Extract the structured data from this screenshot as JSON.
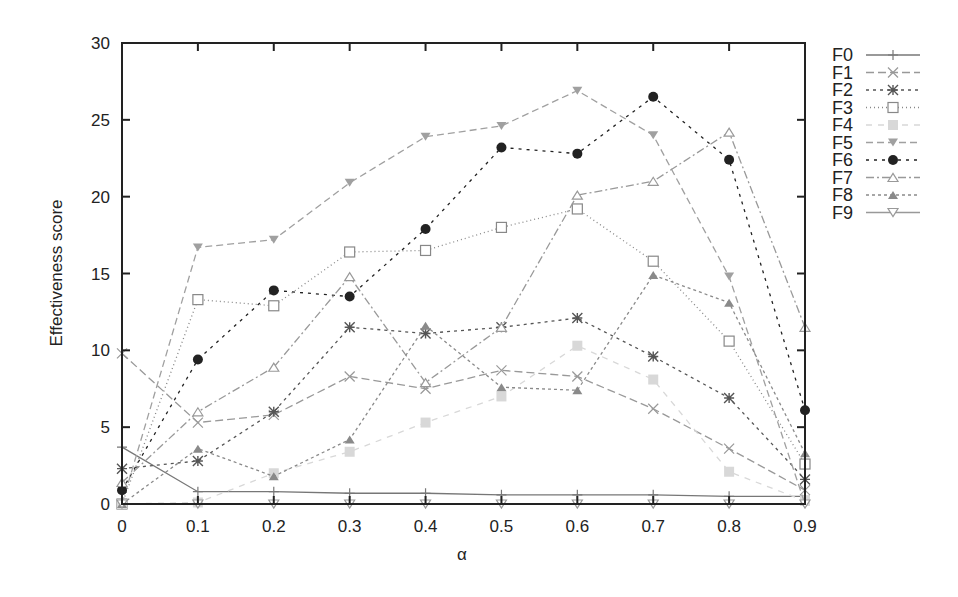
{
  "chart_data": {
    "type": "line",
    "title": "",
    "xlabel": "α",
    "ylabel": "Effectiveness score",
    "xlim": [
      0,
      0.9
    ],
    "ylim": [
      0,
      30
    ],
    "grid": false,
    "legend_position": "right-outside",
    "x": [
      0,
      0.1,
      0.2,
      0.3,
      0.4,
      0.5,
      0.6,
      0.7,
      0.8,
      0.9
    ],
    "x_tick_labels": [
      "0",
      "0.1",
      "0.2",
      "0.3",
      "0.4",
      "0.5",
      "0.6",
      "0.7",
      "0.8",
      "0.9"
    ],
    "y_ticks": [
      0,
      5,
      10,
      15,
      20,
      25,
      30
    ],
    "y_tick_labels": [
      "0",
      "5",
      "10",
      "15",
      "20",
      "25",
      "30"
    ],
    "series": [
      {
        "name": "F0",
        "marker": "plus",
        "dash": "solid",
        "color": "#777777",
        "values": [
          3.7,
          0.8,
          0.8,
          0.7,
          0.7,
          0.6,
          0.6,
          0.6,
          0.5,
          0.5
        ]
      },
      {
        "name": "F1",
        "marker": "x",
        "dash": "8,4",
        "color": "#999999",
        "values": [
          9.8,
          5.3,
          5.8,
          8.3,
          7.5,
          8.7,
          8.3,
          6.2,
          3.6,
          0.9
        ]
      },
      {
        "name": "F2",
        "marker": "star",
        "dash": "3,4",
        "color": "#555555",
        "values": [
          2.3,
          2.8,
          6.0,
          11.5,
          11.1,
          11.5,
          12.1,
          9.6,
          6.9,
          1.6
        ]
      },
      {
        "name": "F3",
        "marker": "square-open",
        "dash": "1,3",
        "color": "#888888",
        "values": [
          0.0,
          13.3,
          12.9,
          16.4,
          16.5,
          18.0,
          19.2,
          15.8,
          10.6,
          2.6
        ]
      },
      {
        "name": "F4",
        "marker": "square-filled",
        "dash": "6,6",
        "color": "#d8d8d8",
        "values": [
          0.0,
          0.1,
          2.0,
          3.4,
          5.3,
          7.0,
          10.3,
          8.1,
          2.1,
          0.2
        ]
      },
      {
        "name": "F5",
        "marker": "triangle-down-filled",
        "dash": "7,4",
        "color": "#a0a0a0",
        "values": [
          0.0,
          16.7,
          17.2,
          20.9,
          23.9,
          24.6,
          26.9,
          24.0,
          14.8,
          0.0
        ]
      },
      {
        "name": "F6",
        "marker": "circle-filled",
        "dash": "3,5",
        "color": "#222222",
        "values": [
          0.9,
          9.4,
          13.9,
          13.5,
          17.9,
          23.2,
          22.8,
          26.5,
          22.4,
          6.1
        ]
      },
      {
        "name": "F7",
        "marker": "triangle-up-open",
        "dash": "8,3,2,3",
        "color": "#999999",
        "values": [
          1.4,
          6.0,
          8.9,
          14.8,
          7.9,
          11.5,
          20.1,
          21.0,
          24.2,
          11.5
        ]
      },
      {
        "name": "F8",
        "marker": "triangle-up-filled",
        "dash": "3,3",
        "color": "#8a8a8a",
        "values": [
          0.0,
          3.6,
          1.8,
          4.2,
          11.6,
          7.6,
          7.4,
          14.9,
          13.1,
          3.3
        ]
      },
      {
        "name": "F9",
        "marker": "triangle-down-open",
        "dash": "solid",
        "color": "#999999",
        "values": [
          0.0,
          0.0,
          0.0,
          0.0,
          0.0,
          0.0,
          0.0,
          0.0,
          0.0,
          0.0
        ]
      }
    ]
  }
}
